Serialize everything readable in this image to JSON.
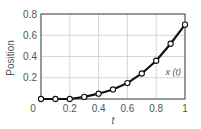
{
  "chart_data": {
    "type": "line",
    "title": "",
    "xlabel": "t",
    "ylabel": "Position",
    "xlim": [
      0,
      1
    ],
    "ylim": [
      0,
      0.8
    ],
    "xticks": [
      "0",
      "0.2",
      "0.4",
      "0.6",
      "0.8",
      "1"
    ],
    "yticks": [
      "0.2",
      "0.4",
      "0.6",
      "0.8"
    ],
    "grid": true,
    "series": [
      {
        "name": "x(t)",
        "x": [
          0,
          0.1,
          0.2,
          0.3,
          0.4,
          0.5,
          0.6,
          0.7,
          0.8,
          0.9,
          1.0
        ],
        "values": [
          0.0,
          0.0,
          0.0,
          0.02,
          0.05,
          0.09,
          0.15,
          0.24,
          0.36,
          0.52,
          0.7
        ]
      }
    ],
    "annotations": [
      {
        "text": "x (t)",
        "x": 0.83,
        "y": 0.3
      }
    ]
  }
}
